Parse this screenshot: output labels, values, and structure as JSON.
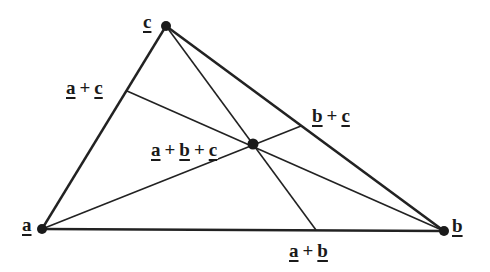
{
  "diagram": {
    "type": "triangle-medians",
    "stroke_color": "#222222",
    "vertices": {
      "a": {
        "x": 42,
        "y": 229,
        "label": "a"
      },
      "b": {
        "x": 444,
        "y": 231,
        "label": "b"
      },
      "c": {
        "x": 166,
        "y": 26,
        "label": "c"
      }
    },
    "centroid": {
      "x": 253,
      "y": 144,
      "label_parts": [
        "a",
        "+",
        "b",
        "+",
        "c"
      ]
    },
    "midpoints": {
      "ac": {
        "x": 127,
        "y": 91,
        "label_parts": [
          "a",
          "+",
          "c"
        ]
      },
      "bc": {
        "x": 301,
        "y": 126,
        "label_parts": [
          "b",
          "+",
          "c"
        ]
      },
      "ab": {
        "x": 316,
        "y": 230,
        "label_parts": [
          "a",
          "+",
          "b"
        ]
      }
    }
  }
}
